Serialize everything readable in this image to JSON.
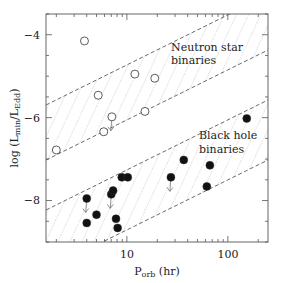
{
  "chart_data": {
    "type": "scatter",
    "title": "",
    "xlabel": "P_orb (hr)",
    "xlabel_main": "P",
    "xlabel_sub": "orb",
    "xlabel_unit": "(hr)",
    "ylabel": "log (L_min/L_Edd)",
    "ylabel_parts": {
      "pre": "log (L",
      "sub1": "min",
      "mid": "/L",
      "sub2": "Edd",
      "post": ")"
    },
    "xscale": "log",
    "xlim": [
      1.58,
      250
    ],
    "ylim": [
      -9.0,
      -3.5
    ],
    "x_ticks": [
      {
        "value": 10,
        "label": "10"
      },
      {
        "value": 100,
        "label": "100"
      }
    ],
    "y_ticks": [
      {
        "value": -4,
        "label": "−4"
      },
      {
        "value": -6,
        "label": "−6"
      },
      {
        "value": -8,
        "label": "−8"
      }
    ],
    "grid": false,
    "legend": null,
    "annotations": [
      {
        "text": "Neutron star",
        "x": 22,
        "y": -4.4
      },
      {
        "text": "binaries",
        "x": 22,
        "y": -4.65
      },
      {
        "text": "Black hole",
        "x": 47,
        "y": -6.45
      },
      {
        "text": "binaries",
        "x": 47,
        "y": -6.8
      }
    ],
    "bands": [
      {
        "name": "Neutron star binaries",
        "upper": [
          [
            1.58,
            -5.73
          ],
          [
            230,
            -3.5
          ]
        ],
        "lower": [
          [
            1.58,
            -7.07
          ],
          [
            250,
            -4.41
          ]
        ]
      },
      {
        "name": "Black hole binaries",
        "upper": [
          [
            1.58,
            -8.27
          ],
          [
            250,
            -5.59
          ]
        ],
        "lower": [
          [
            5.3,
            -9.0
          ],
          [
            250,
            -7.05
          ]
        ]
      }
    ],
    "series": [
      {
        "name": "Neutron star binaries",
        "marker": "open-circle",
        "points": [
          {
            "x": 3.8,
            "y": -4.15,
            "upper_limit": false
          },
          {
            "x": 5.2,
            "y": -5.46,
            "upper_limit": false
          },
          {
            "x": 12.0,
            "y": -4.95,
            "upper_limit": false
          },
          {
            "x": 18.9,
            "y": -5.05,
            "upper_limit": false
          },
          {
            "x": 15.1,
            "y": -5.85,
            "upper_limit": false
          },
          {
            "x": 7.1,
            "y": -5.98,
            "upper_limit": true
          },
          {
            "x": 5.9,
            "y": -6.34,
            "upper_limit": false
          },
          {
            "x": 2.0,
            "y": -6.78,
            "upper_limit": false
          }
        ]
      },
      {
        "name": "Black hole binaries",
        "marker": "filled-circle",
        "points": [
          {
            "x": 4.0,
            "y": -7.95,
            "upper_limit": true
          },
          {
            "x": 5.0,
            "y": -8.34,
            "upper_limit": false
          },
          {
            "x": 4.0,
            "y": -8.54,
            "upper_limit": false
          },
          {
            "x": 7.0,
            "y": -7.85,
            "upper_limit": true
          },
          {
            "x": 7.3,
            "y": -7.76,
            "upper_limit": false
          },
          {
            "x": 8.9,
            "y": -7.44,
            "upper_limit": false
          },
          {
            "x": 10.2,
            "y": -7.44,
            "upper_limit": false
          },
          {
            "x": 7.8,
            "y": -8.44,
            "upper_limit": false
          },
          {
            "x": 8.1,
            "y": -8.66,
            "upper_limit": false
          },
          {
            "x": 154,
            "y": -6.02,
            "upper_limit": false
          },
          {
            "x": 36.6,
            "y": -7.02,
            "upper_limit": false
          },
          {
            "x": 66.4,
            "y": -7.15,
            "upper_limit": false
          },
          {
            "x": 27.3,
            "y": -7.44,
            "upper_limit": true
          },
          {
            "x": 61.9,
            "y": -7.66,
            "upper_limit": false
          }
        ]
      }
    ]
  },
  "labels": {
    "ns_line1": "Neutron star",
    "ns_line2": "binaries",
    "bh_line1": "Black hole",
    "bh_line2": "binaries",
    "tick_x_10": "10",
    "tick_x_100": "100",
    "tick_y_m4": "−4",
    "tick_y_m6": "−6",
    "tick_y_m8": "−8",
    "x_main": "P",
    "x_sub": "orb",
    "x_unit": " (hr)",
    "y_pre": "log (L",
    "y_sub1": "min",
    "y_mid": "/L",
    "y_sub2": "Edd",
    "y_post": ")"
  }
}
